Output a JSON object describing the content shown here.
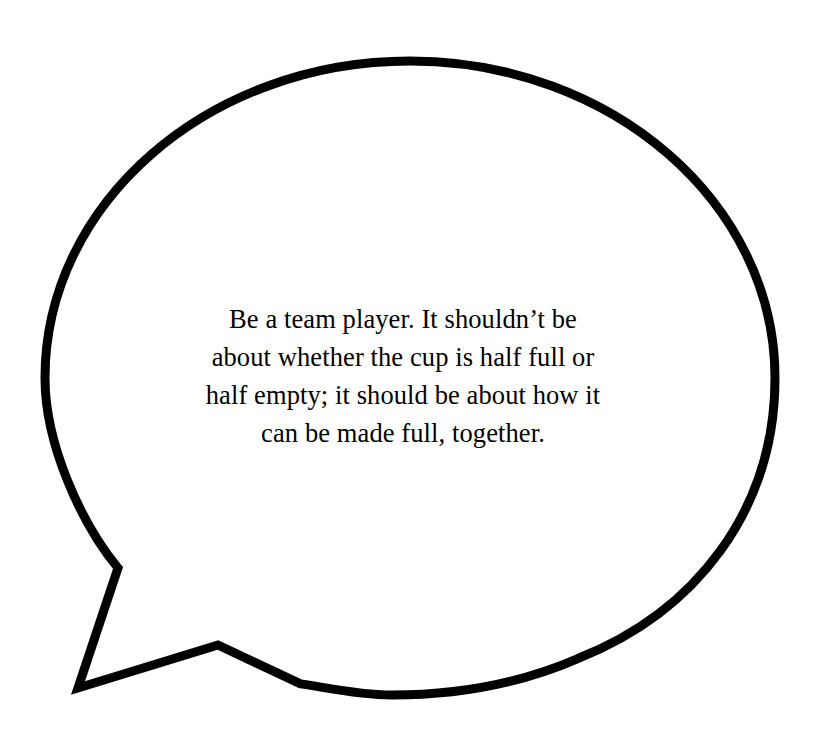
{
  "canvas": {
    "width": 822,
    "height": 732,
    "background_color": "#ffffff"
  },
  "bubble": {
    "name": "speech-bubble",
    "shape": "ellipse-with-polygonal-tail",
    "stroke_color": "#000000",
    "fill_color": "#ffffff",
    "stroke_width": 9,
    "center_x": 410,
    "center_y": 378,
    "radius_x": 365,
    "radius_y": 317,
    "tail": {
      "name": "speech-bubble-tail",
      "upper_join_x": 138,
      "upper_join_y": 528,
      "kink_x": 118,
      "kink_y": 568,
      "apex_x": 78,
      "apex_y": 688,
      "lower_kink_x": 218,
      "lower_kink_y": 645,
      "lower_join_x": 300,
      "lower_join_y": 672
    }
  },
  "quote": {
    "name": "quote-text",
    "full_text": "Be a team player. It shouldn’t be about whether the cup is half full or half empty; it should be about how it can be made full, together.",
    "text_color": "#000000",
    "lines": [
      "Be a team player. It shouldn’t be",
      "about whether the cup is half full or",
      "half empty; it should be about how it",
      "can be made full, together."
    ]
  }
}
